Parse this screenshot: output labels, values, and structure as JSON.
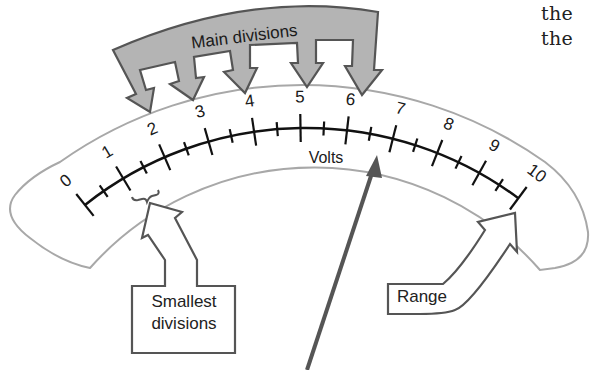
{
  "diagram": {
    "scale": {
      "unit_label": "Volts",
      "min": 0,
      "max": 10,
      "tick_labels": [
        "0",
        "1",
        "2",
        "3",
        "4",
        "5",
        "6",
        "7",
        "8",
        "9",
        "10"
      ],
      "minor_per_major": 2
    },
    "callouts": {
      "main_divisions": "Main divisions",
      "smallest_line1": "Smallest",
      "smallest_line2": "divisions",
      "range": "Range"
    },
    "pointer": {
      "value": 6.5,
      "color": "#555555"
    },
    "side_text": [
      "the",
      "the"
    ],
    "colors": {
      "callout_fill": "#b4b4b4",
      "callout_stroke": "#555555",
      "dial_outline": "#a8a8a8",
      "scale_ink": "#111111"
    }
  }
}
